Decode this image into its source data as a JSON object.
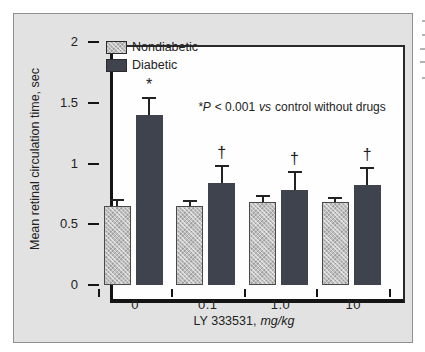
{
  "chart_data": {
    "type": "bar",
    "title": "",
    "categories": [
      "0",
      "0.1",
      "1.0",
      "10"
    ],
    "series": [
      {
        "name": "Nondiabetic",
        "values": [
          0.65,
          0.65,
          0.68,
          0.68
        ],
        "errors_plus": [
          0.05,
          0.04,
          0.05,
          0.04
        ],
        "color": "#bfbfbf",
        "pattern": "crosshatch"
      },
      {
        "name": "Diabetic",
        "values": [
          1.4,
          0.84,
          0.78,
          0.82
        ],
        "errors_plus": [
          0.14,
          0.14,
          0.15,
          0.14
        ],
        "color": "#3e434e",
        "pattern": "solid"
      }
    ],
    "sig_markers_on_diabetic": [
      "*",
      "†",
      "†",
      "†"
    ],
    "xlabel": "LY 333531, mg/kg",
    "xlabel_parts": {
      "main": "LY 333531,",
      "unit": "mg/kg"
    },
    "ylabel": "Mean retinal circulation time, sec",
    "ylim": [
      0,
      2
    ],
    "yticks": [
      0,
      0.5,
      1,
      1.5,
      2
    ],
    "grid": "off",
    "legend_position": "top-left inside plot",
    "annotation": "*P < 0.001 vs control without drugs",
    "annotation_parts": {
      "p": "*P",
      "mid": "< 0.001",
      "vs": "vs",
      "tail": "control without drugs"
    },
    "axis_color": "#141414",
    "plot_background": "#fefefe",
    "panel_background": "#e2e2e2"
  },
  "artifacts": {
    "right_edge_text_fragments": [
      {
        "y": 20,
        "w": 3
      },
      {
        "y": 34,
        "w": 3
      },
      {
        "y": 48,
        "w": 5
      },
      {
        "y": 61,
        "w": 5
      },
      {
        "y": 77,
        "w": 3
      }
    ]
  }
}
